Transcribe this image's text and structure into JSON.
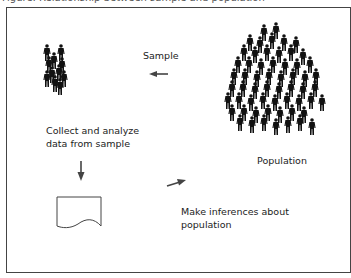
{
  "diagram": {
    "caption_partial": "Figure: Relationship between sample and population",
    "labels": {
      "sample": "Sample",
      "collect": "Collect and analyze\ndata from sample",
      "population": "Population",
      "infer": "Make inferences about\npopulation"
    },
    "icons": {
      "sample_group": "small-crowd-icon",
      "population_group": "large-crowd-icon",
      "document": "document-icon",
      "arrow_sample": "arrow-left-icon",
      "arrow_collect": "arrow-down-icon",
      "arrow_infer": "arrow-up-right-icon"
    },
    "colors": {
      "figure": "#111111",
      "arrow": "#444444",
      "border": "#444444",
      "text": "#222222"
    },
    "flow": [
      {
        "from": "Population",
        "to": "Sample",
        "via": "arrow-left"
      },
      {
        "from": "Sample",
        "to": "Collect and analyze data from sample",
        "via": "arrow-down"
      },
      {
        "from": "Document",
        "to": "Make inferences about population",
        "via": "arrow-up-right"
      }
    ]
  }
}
